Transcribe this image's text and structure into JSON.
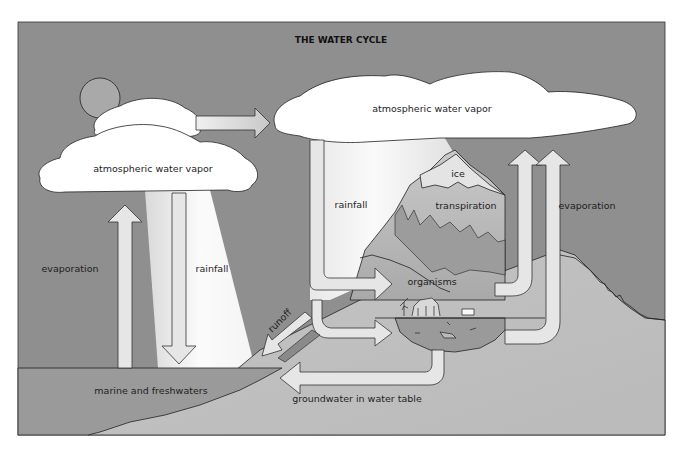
{
  "diagram": {
    "title": "THE WATER CYCLE",
    "labels": {
      "cloud_left": "atmospheric water vapor",
      "cloud_right": "atmospheric water vapor",
      "evaporation_left": "evaporation",
      "rainfall_left": "rainfall",
      "rainfall_right": "rainfall",
      "ice": "ice",
      "transpiration": "transpiration",
      "evaporation_right": "evaporation",
      "organisms": "organisms",
      "runoff": "runoff",
      "marine": "marine and freshwaters",
      "groundwater": "groundwater in water table"
    },
    "flows": [
      {
        "from": "marine and freshwaters",
        "to": "atmospheric water vapor (left)",
        "label": "evaporation"
      },
      {
        "from": "atmospheric water vapor (left)",
        "to": "marine and freshwaters",
        "label": "rainfall"
      },
      {
        "from": "atmospheric water vapor (left)",
        "to": "atmospheric water vapor (right)",
        "label": ""
      },
      {
        "from": "atmospheric water vapor (right)",
        "to": "organisms / land",
        "label": "rainfall"
      },
      {
        "from": "land",
        "to": "marine and freshwaters",
        "label": "runoff"
      },
      {
        "from": "land / lake",
        "to": "marine and freshwaters",
        "label": "groundwater in water table"
      },
      {
        "from": "organisms",
        "to": "atmospheric water vapor (right)",
        "label": "transpiration"
      },
      {
        "from": "land / lake",
        "to": "atmospheric water vapor (right)",
        "label": "evaporation"
      }
    ],
    "colors": {
      "sky": "#8c8c8c",
      "cloud": "#ffffff",
      "sun": "#a9a9a9",
      "water": "#9a9a9a",
      "land": "#bdbdbd",
      "mountain_mid": "#a5a5a5",
      "arrow_fill": "#e6e6e6",
      "rain_shaft": "#f2f2f2",
      "outline": "#222222"
    }
  }
}
